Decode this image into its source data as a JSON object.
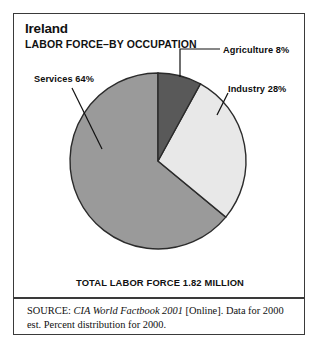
{
  "figure": {
    "title": "Ireland",
    "subtitle": "LABOR FORCE–BY OCCUPATION",
    "total_caption": "TOTAL LABOR FORCE 1.82 MILLION"
  },
  "callouts": {
    "agriculture": "Agriculture 8%",
    "industry": "Industry 28%",
    "services": "Services 64%"
  },
  "source": {
    "prefix": "SOURCE:",
    "publication": "CIA World Factbook 2001",
    "rest": " [Online]. Data for 2000 est. Percent distribution for 2000."
  },
  "colors": {
    "agriculture": "#595959",
    "industry": "#e8e8e8",
    "services": "#9a9a9a",
    "outline": "#2b2b2b",
    "frame": "#3a3a3a",
    "text": "#111111"
  },
  "chart_data": {
    "type": "pie",
    "subtitle": "LABOR FORCE–BY OCCUPATION",
    "categories": [
      "Agriculture",
      "Industry",
      "Services"
    ],
    "values": [
      8,
      28,
      64
    ],
    "unit": "percent",
    "labels": [
      "Agriculture 8%",
      "Industry 28%",
      "Services 64%"
    ],
    "slice_colors": [
      "#595959",
      "#e8e8e8",
      "#9a9a9a"
    ],
    "start_angle_deg": 0,
    "direction": "clockwise",
    "total_label": "TOTAL LABOR FORCE 1.82 MILLION",
    "total_value": 1.82,
    "total_unit": "million",
    "legend": "none (direct labels with leader lines)",
    "grid": false
  }
}
